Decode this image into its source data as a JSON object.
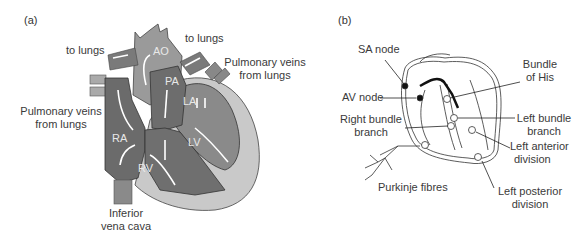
{
  "panels": [
    {
      "tag": "(a)",
      "title": "Blood flow through the heart",
      "chambers": {
        "ao": "AO",
        "pa": "PA",
        "la": "LA",
        "lv": "LV",
        "ra": "RA",
        "rv": "RV"
      },
      "labels": {
        "to_lungs_left": "to lungs",
        "to_lungs_right": "to lungs",
        "pulm_veins_left_1": "Pulmonary veins",
        "pulm_veins_left_2": "from lungs",
        "pulm_veins_right_1": "Pulmonary veins",
        "pulm_veins_right_2": "from lungs",
        "ivc_1": "Inferior",
        "ivc_2": "vena cava"
      },
      "colors": {
        "right_heart": "#6e6e6e",
        "left_heart": "#8c8c8c",
        "pericardium": "#c8c8c8",
        "aorta": "#9a9a9a",
        "arrows": "#ffffff"
      }
    },
    {
      "tag": "(b)",
      "title": "Cardiac conduction system",
      "labels": {
        "sa_node": "SA node",
        "av_node": "AV node",
        "bundle_his_1": "Bundle",
        "bundle_his_2": "of His",
        "right_bundle_1": "Right bundle",
        "right_bundle_2": "branch",
        "left_bundle_1": "Left bundle",
        "left_bundle_2": "branch",
        "left_anterior_1": "Left anterior",
        "left_anterior_2": "division",
        "left_posterior_1": "Left posterior",
        "left_posterior_2": "division",
        "purkinje": "Purkinje fibres"
      }
    }
  ]
}
